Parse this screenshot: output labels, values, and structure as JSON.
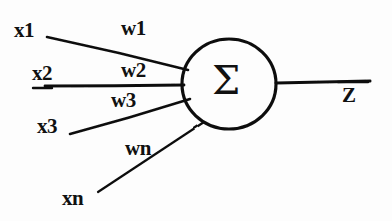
{
  "diagram": {
    "style": "hand-drawn",
    "ink_color": "#111111",
    "background_color": "#fdfdfd",
    "node": {
      "symbol": "Σ",
      "symbol_name": "sigma-summation",
      "shape": "ellipse",
      "cx": 229,
      "cy": 84,
      "rx": 47,
      "ry": 45
    },
    "inputs": [
      {
        "id": "x1",
        "label": "x1",
        "label_x": 14,
        "label_y": 20,
        "line": {
          "x1": 47,
          "y1": 37,
          "x2": 188,
          "y2": 70
        }
      },
      {
        "id": "x2",
        "label": "x2",
        "label_x": 32,
        "label_y": 63,
        "line": {
          "x1": 45,
          "y1": 86,
          "x2": 184,
          "y2": 84
        }
      },
      {
        "id": "x3",
        "label": "x3",
        "label_x": 37,
        "label_y": 116,
        "line": {
          "x1": 70,
          "y1": 134,
          "x2": 190,
          "y2": 99
        }
      },
      {
        "id": "xn",
        "label": "xn",
        "label_x": 62,
        "label_y": 188,
        "line": {
          "x1": 98,
          "y1": 192,
          "x2": 204,
          "y2": 122
        }
      }
    ],
    "weights": [
      {
        "id": "w1",
        "label": "w1",
        "label_x": 121,
        "label_y": 18
      },
      {
        "id": "w2",
        "label": "w2",
        "label_x": 121,
        "label_y": 60
      },
      {
        "id": "w3",
        "label": "w3",
        "label_x": 111,
        "label_y": 90
      },
      {
        "id": "wn",
        "label": "wn",
        "label_x": 125,
        "label_y": 138
      }
    ],
    "output": {
      "id": "z",
      "label": "Z",
      "label_x": 342,
      "label_y": 85,
      "line": {
        "x1": 276,
        "y1": 83,
        "x2": 370,
        "y2": 81
      }
    }
  }
}
